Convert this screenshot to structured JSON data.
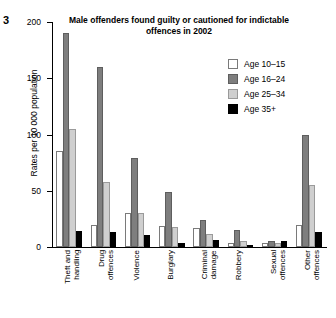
{
  "figure_number": "3",
  "chart_data": {
    "type": "bar",
    "title": "Male offenders found guilty or cautioned\nfor indictable offences in 2002",
    "xlabel": "",
    "ylabel": "Rates per 10 000 population",
    "ylim": [
      0,
      200
    ],
    "yticks": [
      0,
      50,
      100,
      150,
      200
    ],
    "ytick_labels": [
      "0",
      "50",
      "100",
      "150",
      "200"
    ],
    "grid": false,
    "legend_position": "top-right",
    "categories": [
      "Theft and\nhandling",
      "Drug\noffences",
      "Violence",
      "Burglary",
      "Criminal\ndamage",
      "Robbery",
      "Sexual\noffences",
      "Other\noffences"
    ],
    "series": [
      {
        "name": "Age 10–15",
        "color": "#ffffff",
        "values": [
          85,
          20,
          30,
          19,
          17,
          4,
          4,
          20
        ]
      },
      {
        "name": "Age 16–24",
        "color": "#7e7e7e",
        "values": [
          190,
          160,
          79,
          49,
          24,
          15,
          5,
          100
        ]
      },
      {
        "name": "Age 25–34",
        "color": "#cfcfcf",
        "values": [
          105,
          58,
          30,
          18,
          12,
          5,
          4,
          55
        ]
      },
      {
        "name": "Age 35+",
        "color": "#000000",
        "values": [
          14,
          13,
          11,
          4,
          6,
          1,
          5,
          13
        ]
      }
    ]
  }
}
